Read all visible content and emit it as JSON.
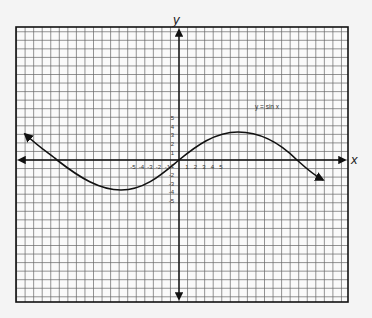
{
  "chart_data": {
    "type": "line",
    "title": "",
    "xlabel": "x",
    "ylabel": "y",
    "annotation": "y = sin x",
    "x_tick_labels": [
      "-5",
      "-4",
      "-3",
      "-2",
      "-1",
      "1",
      "2",
      "3",
      "4",
      "5"
    ],
    "y_tick_labels": [
      "5",
      "4",
      "3",
      "2",
      "1",
      "-1",
      "-2",
      "-3",
      "-4",
      "-5"
    ],
    "grid": true,
    "series": [
      {
        "name": "y = sin x",
        "description": "Smooth sinusoidal curve through origin with arrowheads at both ends; local minimum ≈ -3.5 near x ≈ -7, local maximum ≈ 3.5 near x ≈ 7; crosses x-axis near x ≈ -14, 0, 14",
        "points": [
          {
            "x": -18.5,
            "y": 3.0
          },
          {
            "x": -14.5,
            "y": 0
          },
          {
            "x": -7,
            "y": -3.5
          },
          {
            "x": 0,
            "y": 0
          },
          {
            "x": 7,
            "y": 3.5
          },
          {
            "x": 14,
            "y": 0
          },
          {
            "x": 17,
            "y": -2.3
          }
        ]
      }
    ]
  }
}
